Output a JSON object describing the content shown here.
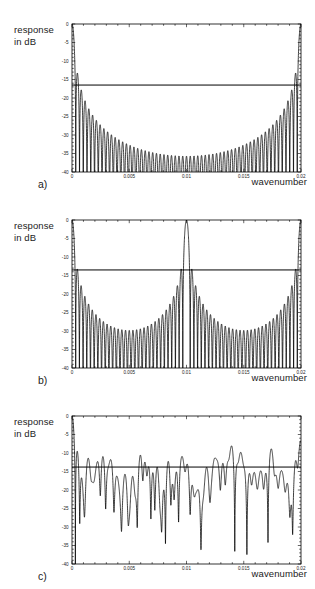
{
  "figure": {
    "panels": [
      {
        "tag": "a)",
        "ylabel": "response\nin dB",
        "xlabel": "wavenumber",
        "chart_data": {
          "type": "line",
          "title": "",
          "xlabel": "wavenumber",
          "ylabel": "response in dB",
          "xlim": [
            0,
            0.02
          ],
          "ylim": [
            -40,
            0
          ],
          "xticks": [
            0,
            0.005,
            0.01,
            0.015,
            0.02
          ],
          "xticklabels": [
            "0",
            "0.005",
            "0.01",
            "0.015",
            "0.02"
          ],
          "yticks": [
            0,
            -5,
            -10,
            -15,
            -20,
            -25,
            -30,
            -35,
            -40
          ],
          "yticklabels": [
            "0",
            "-5",
            "-10",
            "-15",
            "-20",
            "-25",
            "-30",
            "-35",
            "-40"
          ],
          "grid": false,
          "legend": null,
          "annotations": [
            {
              "type": "hline",
              "y": -16.5,
              "label": "sidelobe threshold"
            }
          ],
          "description": "Symmetric array response with main lobes at wavenumber 0 and 0.02; 60 sidelobes between, envelope decaying from -16 dB at edges to about -34 dB at mid-band.",
          "mainlobe_centers": [
            0,
            0.02
          ],
          "n_sidelobes": 60,
          "envelope_peak_db": -16.0,
          "envelope_min_db": -34.0,
          "nulls_db": -40
        }
      },
      {
        "tag": "b)",
        "ylabel": "response\nin dB",
        "xlabel": "wavenumber",
        "chart_data": {
          "type": "line",
          "title": "",
          "xlabel": "wavenumber",
          "ylabel": "response in dB",
          "xlim": [
            0,
            0.02
          ],
          "ylim": [
            -40,
            0
          ],
          "xticks": [
            0,
            0.005,
            0.01,
            0.015,
            0.02
          ],
          "xticklabels": [
            "0",
            "0.005",
            "0.01",
            "0.015",
            "0.02"
          ],
          "yticks": [
            0,
            -5,
            -10,
            -15,
            -20,
            -25,
            -30,
            -35,
            -40
          ],
          "yticklabels": [
            "0",
            "-5",
            "-10",
            "-15",
            "-20",
            "-25",
            "-30",
            "-35",
            "-40"
          ],
          "grid": false,
          "legend": null,
          "annotations": [
            {
              "type": "hline",
              "y": -13.5,
              "label": "sidelobe threshold"
            }
          ],
          "description": "Response with three grating lobes reaching 0 dB at wavenumber 0, 0.01 and 0.02; two sidelobe groups between, envelope decaying from -13.5 dB to about -29 dB at the two mid-band minima.",
          "mainlobe_centers": [
            0,
            0.01,
            0.02
          ],
          "n_sidelobes": 60,
          "envelope_peak_db": -13.5,
          "envelope_min_db": -29.0,
          "nulls_db": -40
        }
      },
      {
        "tag": "c)",
        "ylabel": "response\nin dB",
        "xlabel": "wavenumber",
        "chart_data": {
          "type": "line",
          "title": "",
          "xlabel": "wavenumber",
          "ylabel": "response in dB",
          "xlim": [
            0,
            0.02
          ],
          "ylim": [
            -40,
            0
          ],
          "xticks": [
            0,
            0.005,
            0.01,
            0.015,
            0.02
          ],
          "xticklabels": [
            "0",
            "0.005",
            "0.01",
            "0.015",
            "0.02"
          ],
          "yticks": [
            0,
            -5,
            -10,
            -15,
            -20,
            -25,
            -30,
            -35,
            -40
          ],
          "yticklabels": [
            "0",
            "-5",
            "-10",
            "-15",
            "-20",
            "-25",
            "-30",
            "-35",
            "-40"
          ],
          "grid": false,
          "legend": null,
          "annotations": [
            {
              "type": "hline",
              "y": -13.8,
              "label": "sidelobe threshold"
            }
          ],
          "description": "Aperiodic (randomly thinned) array response: single main lobe at wavenumber 0, irregular broadband sidelobes mostly between -8 dB and -30 dB with several deep nulls reaching -40 dB.",
          "mainlobe_centers": [
            0
          ],
          "envelope_peak_db": -8.0,
          "envelope_min_db": -30.0,
          "nulls_db": -40
        }
      }
    ]
  }
}
